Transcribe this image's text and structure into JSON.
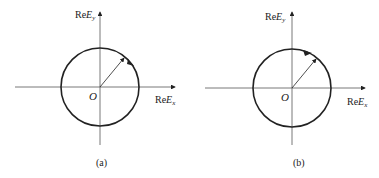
{
  "figure": {
    "panels": [
      {
        "id": "a",
        "caption": "(a)",
        "x_axis_label": {
          "prefix": "Re",
          "var": "E",
          "sub": "x"
        },
        "y_axis_label": {
          "prefix": "Re",
          "var": "E",
          "sub": "y"
        },
        "origin_label": "O",
        "rotation": "clockwise"
      },
      {
        "id": "b",
        "caption": "(b)",
        "x_axis_label": {
          "prefix": "Re",
          "var": "E",
          "sub": "x"
        },
        "y_axis_label": {
          "prefix": "Re",
          "var": "E",
          "sub": "y"
        },
        "origin_label": "O",
        "rotation": "counterclockwise"
      }
    ],
    "colors": {
      "stroke": "#222222",
      "axis": "#555555",
      "background": "#ffffff"
    }
  }
}
